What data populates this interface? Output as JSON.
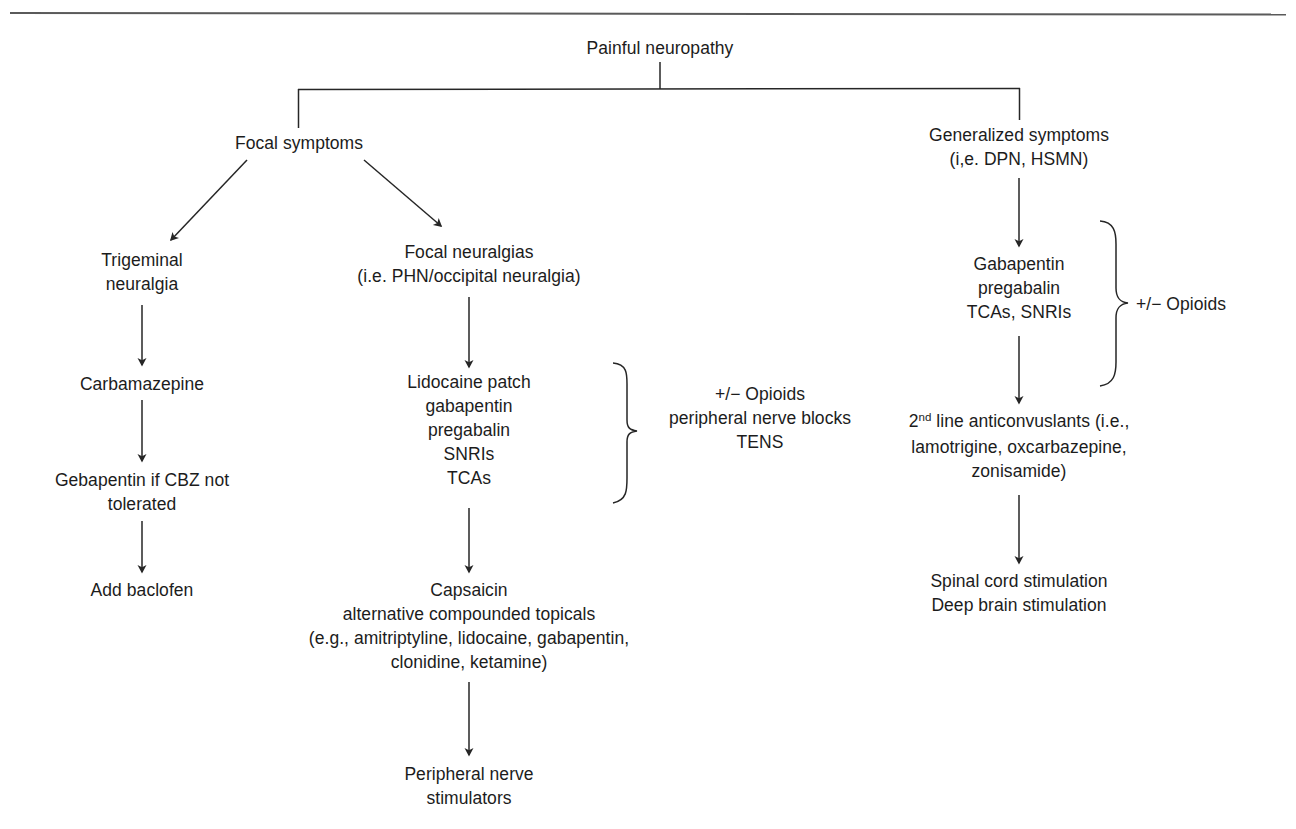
{
  "figure": {
    "title_node": "Painful neuropathy",
    "branches": {
      "focal": {
        "label": "Focal symptoms",
        "trigeminal": {
          "line1": "Trigeminal",
          "line2": "neuralgia",
          "step1": "Carbamazepine",
          "step2_line1": "Gebapentin if CBZ not",
          "step2_line2": "tolerated",
          "step3": "Add baclofen"
        },
        "focal_neuralgias": {
          "line1": "Focal neuralgias",
          "line2": "(i.e. PHN/occipital neuralgia)",
          "first_line_drugs": [
            "Lidocaine patch",
            "gabapentin",
            "pregabalin",
            "SNRIs",
            "TCAs"
          ],
          "adjunct_brace": [
            "+/− Opioids",
            "peripheral nerve blocks",
            "TENS"
          ],
          "topicals": [
            "Capsaicin",
            "alternative compounded topicals",
            "(e.g., amitriptyline, lidocaine, gabapentin,",
            "clonidine, ketamine)"
          ],
          "final": [
            "Peripheral nerve",
            "stimulators"
          ]
        }
      },
      "generalized": {
        "line1": "Generalized symptoms",
        "line2": "(i,e. DPN, HSMN)",
        "first_line_drugs": [
          "Gabapentin",
          "pregabalin",
          "TCAs, SNRIs"
        ],
        "adjunct_brace": "+/− Opioids",
        "second_line": [
          "2nd line anticonvuslants (i.e.,",
          "lamotrigine, oxcarbazepine,",
          "zonisamide)"
        ],
        "second_line_ordinal_base": "2",
        "second_line_ordinal_sup": "nd",
        "second_line_rest": " line anticonvuslants (i.e.,",
        "stimulation": [
          "Spinal cord stimulation",
          "Deep brain stimulation"
        ]
      }
    },
    "colors": {
      "ink": "#1c1c1c",
      "rule": "#5a5a5a",
      "connector": "#262626",
      "background": "#ffffff"
    }
  }
}
